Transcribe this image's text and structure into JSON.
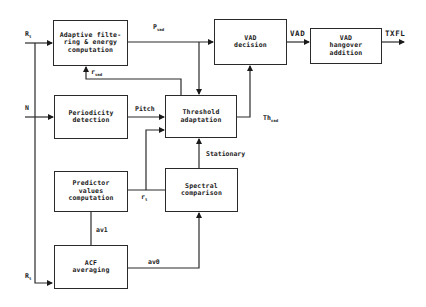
{
  "diagram": {
    "type": "block-diagram",
    "blocks": {
      "adaptive_filtering": {
        "label": "Adaptive filte-\nring & energy\ncomputation"
      },
      "vad_decision": {
        "label": "VAD\ndecision"
      },
      "vad_hangover": {
        "label": "VAD\nhangover\naddition"
      },
      "periodicity": {
        "label": "Periodicity\ndetection"
      },
      "threshold": {
        "label": "Threshold\nadaptation"
      },
      "predictor": {
        "label": "Predictor\nvalues\ncomputation"
      },
      "spectral": {
        "label": "Spectral\ncomparison"
      },
      "acf": {
        "label": "ACF\naveraging"
      }
    },
    "inputs": {
      "r_top": {
        "main": "R",
        "sub": "t"
      },
      "n": {
        "main": "N",
        "sub": ""
      },
      "r_bottom": {
        "main": "R",
        "sub": "t"
      }
    },
    "signals": {
      "pvad": {
        "main": "P",
        "sub": "vad"
      },
      "rvad": {
        "main": "r",
        "sub": "vad"
      },
      "pitch": {
        "main": "Pitch"
      },
      "thvad": {
        "main": "Th",
        "sub": "vad"
      },
      "stationary": {
        "main": "Stationary"
      },
      "rt": {
        "main": "r",
        "sub": "t"
      },
      "av1": {
        "main": "av1"
      },
      "av0": {
        "main": "av0"
      },
      "vad": {
        "main": "VAD"
      },
      "txfl": {
        "main": "TXFL"
      }
    },
    "connections": [
      {
        "from": "R_t (top)",
        "to": "adaptive_filtering"
      },
      {
        "from": "R_t (top)",
        "to": "acf",
        "via": "vertical trunk"
      },
      {
        "from": "N",
        "to": "periodicity"
      },
      {
        "from": "adaptive_filtering",
        "to": "vad_decision",
        "label": "P_vad"
      },
      {
        "from": "adaptive_filtering",
        "to": "threshold",
        "label": "P_vad",
        "via": "branch down"
      },
      {
        "from": "threshold",
        "to": "adaptive_filtering",
        "label": "r_vad"
      },
      {
        "from": "periodicity",
        "to": "threshold",
        "label": "Pitch"
      },
      {
        "from": "predictor",
        "to": "threshold",
        "label": "r_t"
      },
      {
        "from": "predictor",
        "to": "spectral",
        "label": "r_t"
      },
      {
        "from": "spectral",
        "to": "threshold",
        "label": "Stationary"
      },
      {
        "from": "acf",
        "to": "predictor",
        "label": "av1"
      },
      {
        "from": "acf",
        "to": "spectral",
        "label": "av0"
      },
      {
        "from": "threshold",
        "to": "vad_decision",
        "label": "Th_vad"
      },
      {
        "from": "vad_decision",
        "to": "vad_hangover",
        "label": "VAD"
      },
      {
        "from": "vad_hangover",
        "to": "output",
        "label": "TXFL"
      }
    ]
  }
}
